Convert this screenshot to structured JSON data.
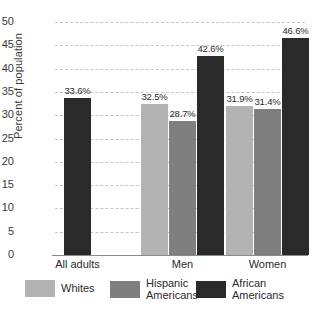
{
  "chart_data": {
    "type": "bar",
    "title": "",
    "subtitle": "",
    "xlabel": "",
    "ylabel": "Percent of population",
    "ylim": [
      0,
      50
    ],
    "ytick_step": 5,
    "yticks": [
      "50",
      "45",
      "40",
      "35",
      "30",
      "25",
      "20",
      "15",
      "10",
      "5",
      "0"
    ],
    "grid": true,
    "grid_axis": "y",
    "grid_style": "dashed",
    "legend_position": "bottom",
    "categories": [
      "All adults",
      "Men",
      "Women"
    ],
    "series": [
      {
        "name": "Whites",
        "color": "#b3b3b3",
        "values": [
          null,
          32.5,
          31.9
        ],
        "labels": [
          "",
          "32.5%",
          "31.9%"
        ]
      },
      {
        "name": "Hispanic\nAmericans",
        "color": "#7f7f7f",
        "values": [
          null,
          28.7,
          31.4
        ],
        "labels": [
          "",
          "28.7%",
          "31.4%"
        ]
      },
      {
        "name": "African\nAmericans",
        "color": "#2a2a2a",
        "values": [
          33.6,
          42.6,
          46.6
        ],
        "labels": [
          "33.6%",
          "42.6%",
          "46.6%"
        ]
      }
    ],
    "bars": [
      {
        "group": "All adults",
        "series": "African Americans",
        "value": 33.6,
        "label": "33.6%",
        "color": "#2a2a2a"
      },
      {
        "group": "Men",
        "series": "Whites",
        "value": 32.5,
        "label": "32.5%",
        "color": "#b3b3b3"
      },
      {
        "group": "Men",
        "series": "Hispanic Americans",
        "value": 28.7,
        "label": "28.7%",
        "color": "#7f7f7f"
      },
      {
        "group": "Men",
        "series": "African Americans",
        "value": 42.6,
        "label": "42.6%",
        "color": "#2a2a2a"
      },
      {
        "group": "Women",
        "series": "Whites",
        "value": 31.9,
        "label": "31.9%",
        "color": "#b3b3b3"
      },
      {
        "group": "Women",
        "series": "Hispanic Americans",
        "value": 31.4,
        "label": "31.4%",
        "color": "#7f7f7f"
      },
      {
        "group": "Women",
        "series": "African Americans",
        "value": 46.6,
        "label": "46.6%",
        "color": "#2a2a2a"
      }
    ]
  },
  "axis": {
    "y_title": "Percent of population",
    "y_ticks": [
      "50",
      "45",
      "40",
      "35",
      "30",
      "25",
      "20",
      "15",
      "10",
      "5",
      "0"
    ]
  },
  "categories": [
    {
      "label": "All adults"
    },
    {
      "label": "Men"
    },
    {
      "label": "Women"
    }
  ],
  "legend": [
    {
      "label": "Whites",
      "color": "#b3b3b3"
    },
    {
      "label": "Hispanic\nAmericans",
      "color": "#7f7f7f"
    },
    {
      "label": "African\nAmericans",
      "color": "#2a2a2a"
    }
  ],
  "values": {
    "v0": "33.6%",
    "v1": "32.5%",
    "v2": "28.7%",
    "v3": "42.6%",
    "v4": "31.9%",
    "v5": "31.4%",
    "v6": "46.6%"
  }
}
